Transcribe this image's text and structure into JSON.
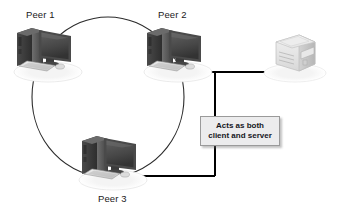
{
  "diagram": {
    "background_color": "#ffffff",
    "ring": {
      "shape": "ellipse",
      "stroke_color": "#2b2b2b",
      "center": [
        108,
        97
      ],
      "radius_x": 76,
      "radius_y": 80
    },
    "nodes": [
      {
        "id": "peer1",
        "label": "Peer 1",
        "icon": "desktop-computer-icon",
        "x": 48,
        "y": 52
      },
      {
        "id": "peer2",
        "label": "Peer 2",
        "icon": "desktop-computer-icon",
        "x": 178,
        "y": 52
      },
      {
        "id": "peer3",
        "label": "Peer 3",
        "icon": "desktop-computer-icon",
        "x": 113,
        "y": 160
      },
      {
        "id": "printer",
        "label": "",
        "icon": "network-printer-icon",
        "x": 295,
        "y": 52
      }
    ],
    "callout": {
      "lines": [
        "Acts as both",
        "client and server"
      ],
      "fill_color": "#ececed",
      "border_color": "#9a9a9a",
      "text_color": "#15161c"
    },
    "connectors": [
      {
        "id": "printer-to-peer2",
        "from": "printer",
        "to": "peer2",
        "arrowhead": "left",
        "color": "#000000"
      },
      {
        "id": "bus-to-peer3",
        "from": "printer-bus",
        "to": "peer3",
        "arrowhead": "left",
        "color": "#000000"
      }
    ]
  }
}
